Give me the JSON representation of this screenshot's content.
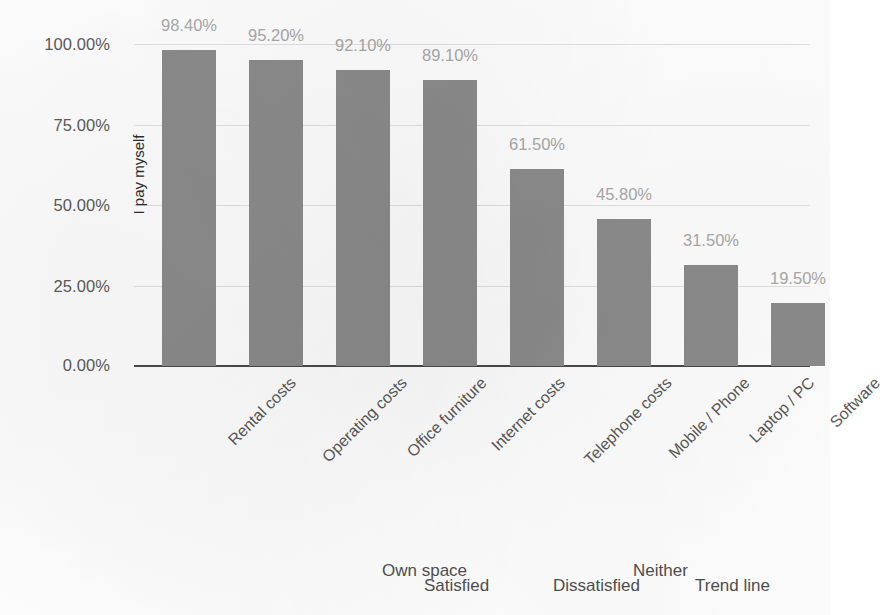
{
  "chart_data": {
    "type": "bar",
    "title": "",
    "xlabel": "",
    "ylabel": "I pay myself",
    "ylim": [
      0,
      100
    ],
    "grid": true,
    "legend_position": "bottom",
    "categories": [
      "Rental costs",
      "Operating costs",
      "Office furniture",
      "Internet costs",
      "Telephone costs",
      "Mobile / Phone",
      "Laptop / PC",
      "Software"
    ],
    "values": [
      98.4,
      95.2,
      92.1,
      89.1,
      61.5,
      45.8,
      31.5,
      19.5
    ],
    "value_labels": [
      "98.40%",
      "95.20%",
      "92.10%",
      "89.10%",
      "61.50%",
      "45.80%",
      "31.50%",
      "19.50%"
    ],
    "y_ticks": [
      0,
      25,
      50,
      75,
      100
    ],
    "y_tick_labels": [
      "0.00%",
      "25.00%",
      "50.00%",
      "75.00%",
      "100.00%"
    ],
    "series": [
      {
        "name": "I pay myself",
        "values": [
          98.4,
          95.2,
          92.1,
          89.1,
          61.5,
          45.8,
          31.5,
          19.5
        ]
      }
    ],
    "legend": [
      "Own space",
      "Satisfied",
      "Dissatisfied",
      "Neither",
      "Trend line"
    ],
    "colors": {
      "bar": "#8c8c8c",
      "gridline": "#e2e2e2",
      "axis": "#4a4a4a",
      "value_label": "#a9a9a9",
      "tick_label": "#5b5b5b",
      "axis_title": "#2e2e2e",
      "legend_label": "#4f4f4f",
      "background": "#ffffff"
    }
  }
}
